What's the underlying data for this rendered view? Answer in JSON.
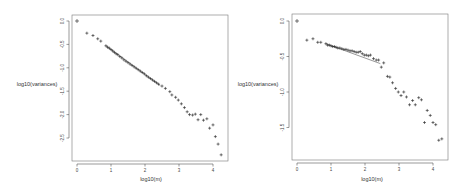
{
  "chart_data": [
    {
      "type": "scatter",
      "title": "",
      "xlabel": "log10(m)",
      "ylabel": "log10(variances)",
      "xlim": [
        0,
        4.3
      ],
      "ylim": [
        -2.9,
        0.05
      ],
      "xticks": [
        "0",
        "1",
        "2",
        "3",
        "4"
      ],
      "yticks": [
        "0.0",
        "-0.5",
        "-1.0",
        "-1.5",
        "-2.0",
        "-2.5"
      ],
      "xtick_values": [
        0,
        1,
        2,
        3,
        4
      ],
      "ytick_values": [
        0.0,
        -0.5,
        -1.0,
        -1.5,
        -2.0,
        -2.5
      ],
      "grid": false,
      "legend": "none",
      "marker": "+",
      "fit_line": {
        "x": [
          0.85,
          2.45
        ],
        "y": [
          -0.53,
          -1.38
        ]
      },
      "points": {
        "x": [
          0,
          0.29,
          0.47,
          0.61,
          0.7,
          0.85,
          0.9,
          0.95,
          1.0,
          1.05,
          1.1,
          1.15,
          1.2,
          1.26,
          1.32,
          1.38,
          1.44,
          1.5,
          1.56,
          1.62,
          1.68,
          1.74,
          1.8,
          1.86,
          1.92,
          1.98,
          2.04,
          2.1,
          2.16,
          2.22,
          2.28,
          2.34,
          2.4,
          2.5,
          2.6,
          2.73,
          2.79,
          2.9,
          2.98,
          3.07,
          3.16,
          3.24,
          3.31,
          3.4,
          3.48,
          3.56,
          3.64,
          3.72,
          3.82,
          3.9,
          4.0,
          4.07,
          4.15,
          4.24
        ],
        "y": [
          0.0,
          -0.26,
          -0.31,
          -0.38,
          -0.43,
          -0.53,
          -0.56,
          -0.58,
          -0.61,
          -0.64,
          -0.67,
          -0.7,
          -0.72,
          -0.76,
          -0.79,
          -0.83,
          -0.86,
          -0.89,
          -0.92,
          -0.95,
          -0.98,
          -1.01,
          -1.04,
          -1.07,
          -1.1,
          -1.13,
          -1.17,
          -1.2,
          -1.23,
          -1.26,
          -1.29,
          -1.32,
          -1.35,
          -1.39,
          -1.44,
          -1.51,
          -1.58,
          -1.63,
          -1.69,
          -1.77,
          -1.85,
          -1.94,
          -2.0,
          -2.01,
          -1.99,
          -2.11,
          -2.0,
          -2.12,
          -2.09,
          -2.29,
          -2.22,
          -2.47,
          -2.63,
          -2.86
        ]
      }
    },
    {
      "type": "scatter",
      "title": "",
      "xlabel": "log10(m)",
      "ylabel": "log10(variances)",
      "xlim": [
        0,
        4.3
      ],
      "ylim": [
        -1.95,
        0.05
      ],
      "xticks": [
        "0",
        "1",
        "2",
        "3",
        "4"
      ],
      "yticks": [
        "0.0",
        "-0.5",
        "-1.0",
        "-1.5"
      ],
      "xtick_values": [
        0,
        1,
        2,
        3,
        4
      ],
      "ytick_values": [
        0.0,
        -0.5,
        -1.0,
        -1.5
      ],
      "grid": false,
      "legend": "none",
      "marker": "+",
      "fit_line": {
        "x": [
          0.85,
          2.45
        ],
        "y": [
          -0.32,
          -0.6
        ]
      },
      "points": {
        "x": [
          0,
          0.29,
          0.47,
          0.61,
          0.7,
          0.85,
          0.9,
          0.95,
          1.0,
          1.05,
          1.1,
          1.15,
          1.2,
          1.26,
          1.32,
          1.38,
          1.44,
          1.5,
          1.56,
          1.62,
          1.68,
          1.74,
          1.8,
          1.86,
          1.92,
          1.98,
          2.04,
          2.1,
          2.16,
          2.25,
          2.33,
          2.4,
          2.48,
          2.55,
          2.66,
          2.73,
          2.81,
          2.9,
          2.98,
          3.06,
          3.14,
          3.22,
          3.31,
          3.4,
          3.48,
          3.58,
          3.66,
          3.75,
          3.83,
          3.92,
          4.0,
          4.08,
          4.17,
          4.26
        ],
        "y": [
          0.0,
          -0.27,
          -0.25,
          -0.3,
          -0.3,
          -0.32,
          -0.34,
          -0.34,
          -0.35,
          -0.36,
          -0.36,
          -0.37,
          -0.38,
          -0.38,
          -0.39,
          -0.4,
          -0.4,
          -0.41,
          -0.42,
          -0.42,
          -0.43,
          -0.44,
          -0.44,
          -0.43,
          -0.46,
          -0.48,
          -0.48,
          -0.49,
          -0.48,
          -0.53,
          -0.55,
          -0.55,
          -0.65,
          -0.59,
          -0.78,
          -0.79,
          -0.87,
          -0.95,
          -1.0,
          -1.05,
          -1.0,
          -1.07,
          -1.18,
          -1.12,
          -1.18,
          -1.08,
          -1.11,
          -1.43,
          -1.26,
          -1.33,
          -1.43,
          -1.46,
          -1.68,
          -1.66
        ]
      }
    }
  ]
}
